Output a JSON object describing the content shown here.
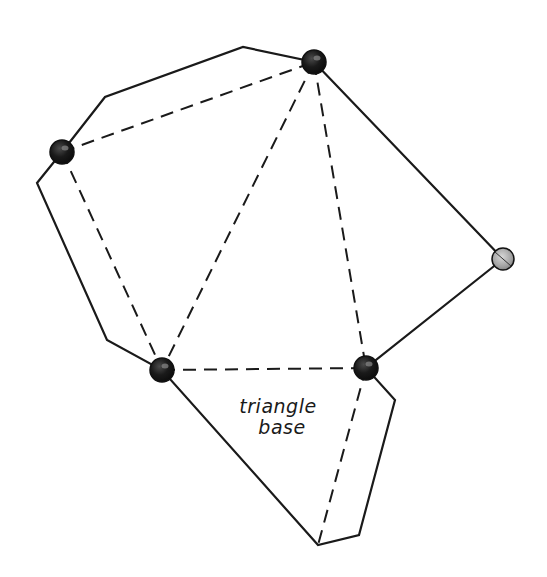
{
  "diagram": {
    "type": "polyhedron-net-sketch",
    "colors": {
      "stroke": "#1a1a1a",
      "vertex_dark": "#141414",
      "vertex_light": "#9a9a9a",
      "background": "#ffffff"
    },
    "label": {
      "line1": "triangle",
      "line2": "base"
    },
    "vertices": [
      {
        "id": "A",
        "x": 314,
        "y": 62,
        "style": "dark"
      },
      {
        "id": "B",
        "x": 62,
        "y": 152,
        "style": "dark"
      },
      {
        "id": "C",
        "x": 162,
        "y": 370,
        "style": "dark"
      },
      {
        "id": "D",
        "x": 366,
        "y": 368,
        "style": "dark"
      },
      {
        "id": "E",
        "x": 503,
        "y": 259,
        "style": "light"
      }
    ],
    "outline_points": "62,152 105,97 243,47 314,62 503,259 366,368 395,400 359,535 318,545 162,370 107,340 37,183 62,152",
    "fold_lines": [
      {
        "x1": 62,
        "y1": 152,
        "x2": 314,
        "y2": 62
      },
      {
        "x1": 62,
        "y1": 152,
        "x2": 162,
        "y2": 370
      },
      {
        "x1": 314,
        "y1": 62,
        "x2": 162,
        "y2": 370
      },
      {
        "x1": 314,
        "y1": 62,
        "x2": 366,
        "y2": 368
      },
      {
        "x1": 162,
        "y1": 370,
        "x2": 366,
        "y2": 368
      },
      {
        "x1": 366,
        "y1": 368,
        "x2": 318,
        "y2": 545
      }
    ]
  }
}
